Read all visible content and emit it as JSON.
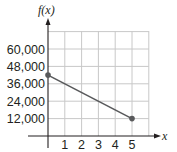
{
  "chart_data": {
    "type": "line",
    "title": "",
    "xlabel": "x",
    "ylabel": "f(x)",
    "x_ticks": [
      "1",
      "2",
      "3",
      "4",
      "5"
    ],
    "y_ticks": [
      "12,000",
      "24,000",
      "36,000",
      "48,000",
      "60,000"
    ],
    "xlim": [
      0,
      6
    ],
    "ylim": [
      0,
      72000
    ],
    "grid": true,
    "legend": null,
    "series": [
      {
        "name": "f(x)",
        "x": [
          0,
          5
        ],
        "values": [
          42000,
          12000
        ],
        "color": "#58595b",
        "markers": "endpoints"
      }
    ]
  },
  "colors": {
    "grid": "#c8c8c8",
    "axis": "#231f20",
    "line": "#58595b",
    "point": "#58595b"
  }
}
